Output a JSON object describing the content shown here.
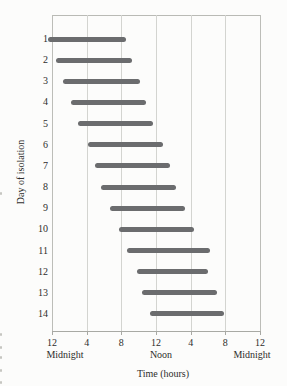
{
  "chart_data": {
    "type": "bar",
    "orientation": "horizontal",
    "title": "",
    "ylabel": "Day of isolation",
    "xlabel": "Time (hours)",
    "x_tick_labels": [
      "12",
      "4",
      "8",
      "12",
      "4",
      "8",
      "12"
    ],
    "x_tick_hours": [
      0,
      4,
      8,
      12,
      16,
      20,
      24
    ],
    "x_axis_annotations": [
      "Midnight",
      "Noon",
      "Midnight"
    ],
    "xlim_hours": [
      0,
      24
    ],
    "grid": "vertical-only",
    "legend": "none",
    "bar_color": "#6b6c6e",
    "gridline_color": "#d3d4d0",
    "categories": [
      "1",
      "2",
      "3",
      "4",
      "5",
      "6",
      "7",
      "8",
      "9",
      "10",
      "11",
      "12",
      "13",
      "14"
    ],
    "bars": [
      {
        "day": "1",
        "start_hour": -0.5,
        "end_hour": 8.5
      },
      {
        "day": "2",
        "start_hour": 0.4,
        "end_hour": 9.2
      },
      {
        "day": "3",
        "start_hour": 1.3,
        "end_hour": 10.1
      },
      {
        "day": "4",
        "start_hour": 2.2,
        "end_hour": 10.9
      },
      {
        "day": "5",
        "start_hour": 3.0,
        "end_hour": 11.6
      },
      {
        "day": "6",
        "start_hour": 4.1,
        "end_hour": 12.8
      },
      {
        "day": "7",
        "start_hour": 4.9,
        "end_hour": 13.6
      },
      {
        "day": "8",
        "start_hour": 5.7,
        "end_hour": 14.3
      },
      {
        "day": "9",
        "start_hour": 6.7,
        "end_hour": 15.4
      },
      {
        "day": "10",
        "start_hour": 7.7,
        "end_hour": 16.4
      },
      {
        "day": "11",
        "start_hour": 8.7,
        "end_hour": 18.2
      },
      {
        "day": "12",
        "start_hour": 9.8,
        "end_hour": 18.0
      },
      {
        "day": "13",
        "start_hour": 10.4,
        "end_hour": 19.0
      },
      {
        "day": "14",
        "start_hour": 11.3,
        "end_hour": 19.8
      }
    ]
  }
}
